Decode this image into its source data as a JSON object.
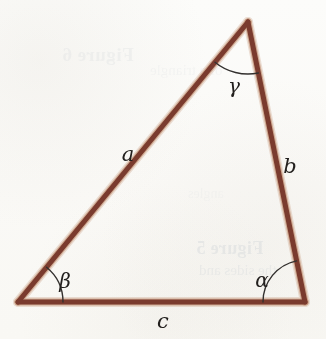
{
  "figure": {
    "kind": "geometry-diagram",
    "shape": "triangle",
    "caption_bleedthrough": "Figure 5",
    "background_color": "#fdfdfc",
    "stroke_color": "#7a3b2e",
    "stroke_highlight_color": "#c79a7e",
    "arc_color": "#33302e",
    "label_color": "#23201e",
    "stroke_width": 5,
    "arc_width": 1.4
  },
  "vertices": {
    "apex": {
      "name": "C",
      "x": 248,
      "y": 22
    },
    "bottom_left": {
      "name": "B",
      "x": 18,
      "y": 302
    },
    "bottom_right": {
      "name": "A",
      "x": 305,
      "y": 302
    }
  },
  "sides": [
    {
      "id": "a",
      "label": "a",
      "label_x": 128,
      "label_y": 155,
      "from": "apex",
      "to": "bottom_left"
    },
    {
      "id": "b",
      "label": "b",
      "label_x": 290,
      "label_y": 167,
      "from": "apex",
      "to": "bottom_right"
    },
    {
      "id": "c",
      "label": "c",
      "label_x": 163,
      "label_y": 322,
      "from": "bottom_left",
      "to": "bottom_right"
    }
  ],
  "angles": [
    {
      "id": "alpha",
      "label": "α",
      "vertex": "bottom_right",
      "label_x": 262,
      "label_y": 281,
      "arc_radius": 42
    },
    {
      "id": "beta",
      "label": "β",
      "vertex": "bottom_left",
      "label_x": 65,
      "label_y": 282,
      "arc_radius": 45
    },
    {
      "id": "gamma",
      "label": "γ",
      "vertex": "apex",
      "label_x": 234,
      "label_y": 87,
      "arc_radius": 52
    }
  ],
  "ghost_layer": {
    "top_line_1": "Figure 6",
    "top_line_2": "of a triangle",
    "middle_line": "angles",
    "figure_line_1": "Figure 5",
    "figure_line_2": "the sides and"
  }
}
